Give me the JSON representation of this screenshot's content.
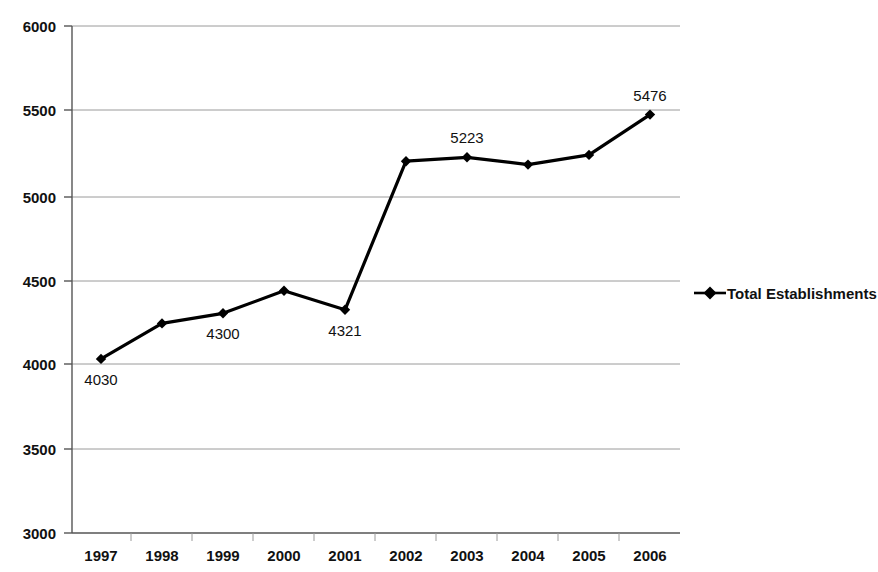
{
  "chart_data": {
    "type": "line",
    "title": "",
    "xlabel": "",
    "ylabel": "",
    "categories": [
      "1997",
      "1998",
      "1999",
      "2000",
      "2001",
      "2002",
      "2003",
      "2004",
      "2005",
      "2006"
    ],
    "series": [
      {
        "name": "Total Establishments",
        "values": [
          4030,
          4240,
          4300,
          4433,
          4321,
          5200,
          5223,
          5180,
          5237,
          5476
        ],
        "marker": "diamond",
        "color": "#000000"
      }
    ],
    "point_labels": [
      {
        "category": "1997",
        "value": 4030,
        "text": "4030",
        "position": "below"
      },
      {
        "category": "1999",
        "value": 4300,
        "text": "4300",
        "position": "below"
      },
      {
        "category": "2001",
        "value": 4321,
        "text": "4321",
        "position": "below"
      },
      {
        "category": "2003",
        "value": 5223,
        "text": "5223",
        "position": "above"
      },
      {
        "category": "2006",
        "value": 5476,
        "text": "5476",
        "position": "above"
      }
    ],
    "ylim": [
      3000,
      6000
    ],
    "ytick_step": 500,
    "yticks": [
      "6000",
      "5500",
      "5000",
      "4500",
      "4000",
      "3500",
      "3000"
    ],
    "grid": true,
    "grid_color": "#9a9a9a",
    "legend_position": "right",
    "legend": [
      "Total Establishments"
    ]
  },
  "legend": {
    "entry_label": "Total Establishments"
  }
}
